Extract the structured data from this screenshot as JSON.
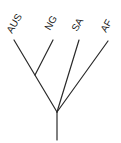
{
  "diagram": {
    "type": "phylogenetic-tree",
    "taxa": [
      {
        "label": "AUS",
        "tip": [
          14,
          40
        ],
        "label_pos": [
          15,
          23
        ]
      },
      {
        "label": "NG",
        "tip": [
          53,
          40
        ],
        "label_pos": [
          52,
          23
        ]
      },
      {
        "label": "SA",
        "tip": [
          79,
          40
        ],
        "label_pos": [
          78,
          25
        ]
      },
      {
        "label": "AF",
        "tip": [
          108,
          41
        ],
        "label_pos": [
          107,
          27
        ]
      }
    ],
    "nodes": {
      "aus_ng": [
        35,
        75
      ],
      "root": [
        57,
        112
      ],
      "trunk_bottom": [
        57,
        140
      ]
    },
    "line_color": "#2a2a2a"
  }
}
